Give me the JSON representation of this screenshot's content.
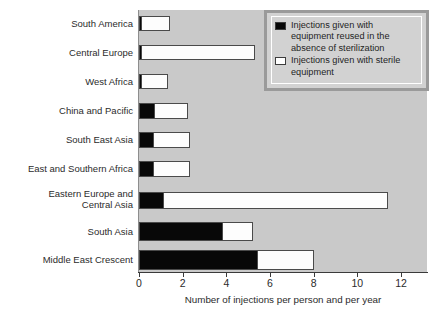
{
  "chart_data": {
    "type": "bar",
    "orientation": "horizontal",
    "stacked": true,
    "title": "",
    "xlabel": "Number of injections per person and per year",
    "ylabel": "",
    "xlim": [
      0,
      13.2
    ],
    "xticks": [
      0,
      2,
      4,
      6,
      8,
      10,
      12
    ],
    "xticklabels": [
      "0",
      "2",
      "4",
      "6",
      "8",
      "10",
      "12"
    ],
    "grid": false,
    "legend_position": "top-right",
    "categories": [
      "South America",
      "Central Europe",
      "West Africa",
      "China and Pacific",
      "South East Asia",
      "East and Southern Africa",
      "Eastern Europe and\nCentral Asia",
      "South Asia",
      "Middle East Crescent"
    ],
    "series": [
      {
        "name": "Injections given with equipment reused in the absence of sterilization",
        "color": "#080808",
        "values": [
          0.05,
          0.12,
          0.15,
          0.73,
          0.68,
          0.7,
          1.15,
          3.85,
          5.45
        ]
      },
      {
        "name": "Injections given with sterile equipment",
        "color": "#ffffff",
        "values": [
          1.28,
          5.18,
          1.2,
          1.52,
          1.65,
          1.65,
          10.25,
          1.35,
          2.55
        ]
      }
    ],
    "totals": [
      1.33,
      5.3,
      1.35,
      2.25,
      2.33,
      2.35,
      11.4,
      5.2,
      8.0
    ]
  },
  "legend": {
    "entries": [
      {
        "swatch": "black-square",
        "label": "Injections given with\nequipment reused in the\nabsence of sterilization"
      },
      {
        "swatch": "white-square",
        "label": "Injections given with sterile\nequipment"
      }
    ]
  },
  "colors": {
    "plot_background": "#c9c9c9",
    "page_background": "#ffffff",
    "bar_dark": "#080808",
    "bar_light": "#fdfdfd",
    "bar_outline": "#4a4a4a",
    "legend_background": "#d2d2d2",
    "legend_border": "#9a9a9a",
    "text": "#2b2b2b"
  }
}
